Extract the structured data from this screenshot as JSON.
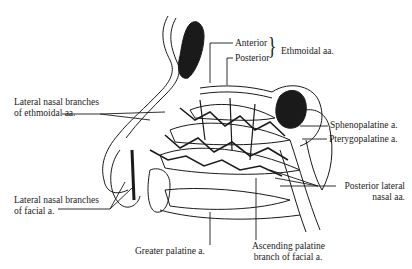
{
  "figure": {
    "labels": {
      "anterior": "Anterior",
      "posterior": "Posterior",
      "ethmoidal_group": "Ethmoidal aa.",
      "lateral_nasal_ethmoidal_line1": "Lateral nasal branches",
      "lateral_nasal_ethmoidal_line2": "of ethmoidal aa.",
      "sphenopalatine": "Sphenopalatine a.",
      "pterygopalatine": "Pterygopalatine a.",
      "posterior_lateral_line1": "Posterior lateral",
      "posterior_lateral_line2": "nasal aa.",
      "lateral_nasal_facial_line1": "Lateral nasal branches",
      "lateral_nasal_facial_line2": "of facial a.",
      "greater_palatine": "Greater palatine a.",
      "ascending_palatine_line1": "Ascending palatine",
      "ascending_palatine_line2": "branch of facial a."
    },
    "colors": {
      "ink": "#1a1a1a",
      "background": "#ffffff"
    }
  }
}
